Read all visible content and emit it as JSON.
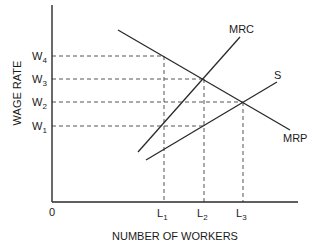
{
  "diagram": {
    "title": "",
    "y_axis_label": "WAGE RATE",
    "x_axis_label": "NUMBER OF WORKERS",
    "origin_label": "0",
    "wage_ticks": [
      {
        "base": "W",
        "sub": "4"
      },
      {
        "base": "W",
        "sub": "3"
      },
      {
        "base": "W",
        "sub": "2"
      },
      {
        "base": "W",
        "sub": "1"
      }
    ],
    "labor_ticks": [
      {
        "base": "L",
        "sub": "1"
      },
      {
        "base": "L",
        "sub": "2"
      },
      {
        "base": "L",
        "sub": "3"
      }
    ],
    "curves": {
      "mrc": "MRC",
      "s": "S",
      "mrp": "MRP"
    },
    "line_color": "#2a2a2a",
    "dash_color": "#555555"
  }
}
